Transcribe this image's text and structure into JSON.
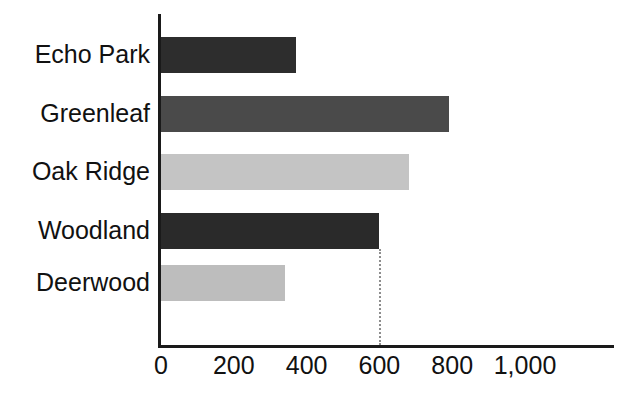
{
  "figure": {
    "top_fragment_text": "",
    "background_color": "#ffffff",
    "axis_color": "#1a1a1a",
    "callout_line_color": "#8d8d8d"
  },
  "chart_data": {
    "type": "bar",
    "orientation": "horizontal",
    "title": "",
    "subtitle": "",
    "xlabel": "",
    "ylabel": "",
    "categories": [
      "Echo Park",
      "Greenleaf",
      "Oak Ridge",
      "Woodland",
      "Deerwood"
    ],
    "values": [
      370,
      790,
      680,
      600,
      340
    ],
    "bar_colors": [
      "#2d2d2d",
      "#4a4a4a",
      "#c4c4c4",
      "#2a2a2a",
      "#bdbdbd"
    ],
    "xlim": [
      0,
      1100
    ],
    "xticks": [
      0,
      200,
      400,
      600,
      800,
      1000
    ],
    "xtick_labels": [
      "0",
      "200",
      "400",
      "600",
      "800",
      "1,000"
    ],
    "grid": false,
    "legend": null,
    "annotations": [
      {
        "name": "reference-line-600",
        "type": "vertical-dotted-line",
        "value": 600,
        "from_category": "Woodland",
        "color": "#8d8d8d"
      }
    ]
  }
}
